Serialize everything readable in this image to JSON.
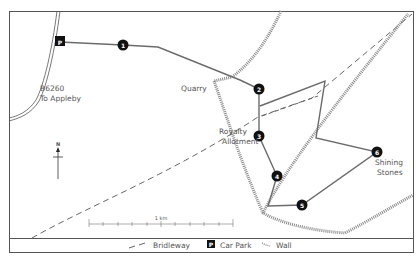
{
  "map": {
    "labels": {
      "road": "B6260",
      "road_dest": "To Appleby",
      "quarry": "Quarry",
      "allotment_1": "Royalty",
      "allotment_2": "Allotment",
      "stones_1": "Shining",
      "stones_2": "Stones",
      "north": "N",
      "scale": "1 km"
    },
    "waypoints": [
      {
        "id": "1",
        "label": "1"
      },
      {
        "id": "2",
        "label": "2"
      },
      {
        "id": "3",
        "label": "3"
      },
      {
        "id": "4",
        "label": "4"
      },
      {
        "id": "5",
        "label": "5"
      },
      {
        "id": "6",
        "label": "6"
      }
    ],
    "car_park_symbol": "P"
  },
  "legend": {
    "bridleway": "Bridleway",
    "car_park": "Car Park",
    "car_park_symbol": "P",
    "wall": "Wall"
  },
  "colors": {
    "route": "#6b6b6b",
    "wall": "#8a8a8a",
    "bridleway": "#666666",
    "frame": "#555555",
    "waypoint": "#111111"
  }
}
